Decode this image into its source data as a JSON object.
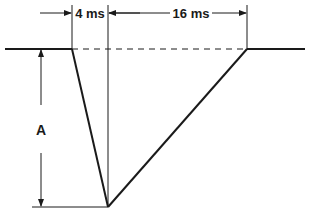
{
  "diagram": {
    "labels": {
      "rise_time": "4 ms",
      "fall_time": "16 ms",
      "amplitude": "A"
    },
    "colors": {
      "line": "#1a1a1a",
      "background": "#ffffff"
    }
  }
}
